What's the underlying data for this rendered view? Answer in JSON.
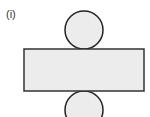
{
  "diagram": {
    "label": "(i)",
    "fill_color": "#ececec",
    "stroke_color": "#222222",
    "shapes": {
      "top_circle": {
        "cx": 84,
        "cy": 30,
        "r": 19
      },
      "rectangle": {
        "x": 24,
        "y": 49,
        "width": 120,
        "height": 42
      },
      "bottom_circle": {
        "cx": 84,
        "cy": 110,
        "r": 19
      }
    }
  }
}
